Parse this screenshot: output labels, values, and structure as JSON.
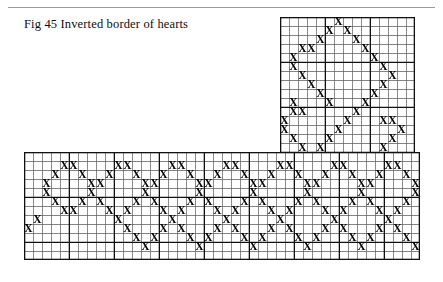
{
  "figure": {
    "caption": "Fig 45 Inverted border of hearts",
    "type": "cross-stitch-chart",
    "shape": "L-shaped corner border",
    "mark_glyph": "X",
    "mark_color": "#000000",
    "grid": {
      "cell_px": 9,
      "thin_line_color": "#5a5a5a",
      "heavy_line_color": "#111111",
      "heavy_every": 5,
      "background": "#ffffff"
    },
    "rule_color": "#9a9a9a",
    "vertical_band": {
      "left": 280,
      "top": 17,
      "cols": 15,
      "rows": 27,
      "marks": [
        [
          7,
          1
        ],
        [
          6,
          2
        ],
        [
          8,
          2
        ],
        [
          5,
          3
        ],
        [
          9,
          3
        ],
        [
          3,
          4
        ],
        [
          4,
          4
        ],
        [
          10,
          4
        ],
        [
          2,
          5
        ],
        [
          11,
          5
        ],
        [
          2,
          6
        ],
        [
          12,
          6
        ],
        [
          3,
          7
        ],
        [
          13,
          7
        ],
        [
          4,
          8
        ],
        [
          12,
          8
        ],
        [
          5,
          9
        ],
        [
          11,
          9
        ],
        [
          6,
          10
        ],
        [
          10,
          10
        ],
        [
          2,
          10
        ],
        [
          3,
          11
        ],
        [
          9,
          11
        ],
        [
          2,
          11
        ],
        [
          1,
          12
        ],
        [
          8,
          12
        ],
        [
          12,
          12
        ],
        [
          13,
          12
        ],
        [
          1,
          13
        ],
        [
          7,
          13
        ],
        [
          14,
          13
        ],
        [
          2,
          14
        ],
        [
          6,
          14
        ],
        [
          13,
          14
        ],
        [
          3,
          15
        ],
        [
          5,
          15
        ],
        [
          12,
          15
        ],
        [
          4,
          16
        ],
        [
          11,
          16
        ],
        [
          5,
          17
        ],
        [
          10,
          17
        ],
        [
          6,
          18
        ],
        [
          9,
          18
        ],
        [
          7,
          19
        ],
        [
          8,
          19
        ],
        [
          8,
          20
        ],
        [
          7,
          20
        ],
        [
          9,
          21
        ],
        [
          6,
          21
        ],
        [
          10,
          22
        ],
        [
          5,
          22
        ],
        [
          11,
          23
        ],
        [
          4,
          23
        ],
        [
          12,
          24
        ],
        [
          3,
          24
        ],
        [
          13,
          25
        ],
        [
          2,
          25
        ],
        [
          13,
          26
        ],
        [
          1,
          26
        ]
      ]
    },
    "horizontal_band": {
      "left": 24,
      "top": 152,
      "cols": 44,
      "rows": 12,
      "marks": [
        [
          5,
          2
        ],
        [
          6,
          2
        ],
        [
          11,
          2
        ],
        [
          12,
          2
        ],
        [
          17,
          2
        ],
        [
          18,
          2
        ],
        [
          23,
          2
        ],
        [
          24,
          2
        ],
        [
          29,
          2
        ],
        [
          30,
          2
        ],
        [
          35,
          2
        ],
        [
          36,
          2
        ],
        [
          41,
          2
        ],
        [
          42,
          2
        ],
        [
          4,
          3
        ],
        [
          7,
          3
        ],
        [
          10,
          3
        ],
        [
          13,
          3
        ],
        [
          16,
          3
        ],
        [
          19,
          3
        ],
        [
          22,
          3
        ],
        [
          25,
          3
        ],
        [
          28,
          3
        ],
        [
          31,
          3
        ],
        [
          34,
          3
        ],
        [
          37,
          3
        ],
        [
          40,
          3
        ],
        [
          43,
          3
        ],
        [
          3,
          4
        ],
        [
          8,
          4
        ],
        [
          9,
          4
        ],
        [
          14,
          4
        ],
        [
          15,
          4
        ],
        [
          20,
          4
        ],
        [
          21,
          4
        ],
        [
          26,
          4
        ],
        [
          27,
          4
        ],
        [
          32,
          4
        ],
        [
          33,
          4
        ],
        [
          38,
          4
        ],
        [
          39,
          4
        ],
        [
          44,
          4
        ],
        [
          3,
          5
        ],
        [
          8,
          5
        ],
        [
          14,
          5
        ],
        [
          20,
          5
        ],
        [
          26,
          5
        ],
        [
          32,
          5
        ],
        [
          38,
          5
        ],
        [
          44,
          5
        ],
        [
          4,
          6
        ],
        [
          7,
          6
        ],
        [
          9,
          6
        ],
        [
          13,
          6
        ],
        [
          15,
          6
        ],
        [
          19,
          6
        ],
        [
          21,
          6
        ],
        [
          25,
          6
        ],
        [
          27,
          6
        ],
        [
          31,
          6
        ],
        [
          33,
          6
        ],
        [
          37,
          6
        ],
        [
          39,
          6
        ],
        [
          43,
          6
        ],
        [
          5,
          7
        ],
        [
          6,
          7
        ],
        [
          10,
          7
        ],
        [
          12,
          7
        ],
        [
          16,
          7
        ],
        [
          18,
          7
        ],
        [
          22,
          7
        ],
        [
          24,
          7
        ],
        [
          28,
          7
        ],
        [
          30,
          7
        ],
        [
          34,
          7
        ],
        [
          36,
          7
        ],
        [
          40,
          7
        ],
        [
          42,
          7
        ],
        [
          11,
          8
        ],
        [
          17,
          8
        ],
        [
          23,
          8
        ],
        [
          29,
          8
        ],
        [
          35,
          8
        ],
        [
          41,
          8
        ],
        [
          2,
          8
        ],
        [
          1,
          9
        ],
        [
          12,
          9
        ],
        [
          16,
          9
        ],
        [
          18,
          9
        ],
        [
          22,
          9
        ],
        [
          24,
          9
        ],
        [
          28,
          9
        ],
        [
          30,
          9
        ],
        [
          34,
          9
        ],
        [
          36,
          9
        ],
        [
          40,
          9
        ],
        [
          42,
          9
        ],
        [
          13,
          10
        ],
        [
          15,
          10
        ],
        [
          19,
          10
        ],
        [
          21,
          10
        ],
        [
          25,
          10
        ],
        [
          27,
          10
        ],
        [
          31,
          10
        ],
        [
          33,
          10
        ],
        [
          37,
          10
        ],
        [
          39,
          10
        ],
        [
          43,
          10
        ],
        [
          14,
          11
        ],
        [
          20,
          11
        ],
        [
          26,
          11
        ],
        [
          32,
          11
        ],
        [
          38,
          11
        ],
        [
          44,
          11
        ]
      ]
    }
  }
}
